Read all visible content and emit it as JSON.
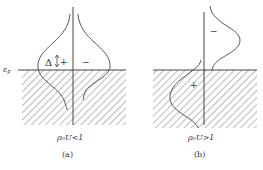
{
  "panels": [
    {
      "id": "a",
      "fermi_label": "ε",
      "fermi_sub": "F",
      "gap_label": "Δ",
      "plus": "+",
      "minus": "−",
      "condition": "ρ₀U<1",
      "caption": "(a)"
    },
    {
      "id": "b",
      "plus": "+",
      "minus": "−",
      "condition": "ρ₀U>1",
      "caption": "(b)"
    }
  ],
  "colors": {
    "line": "#444444",
    "hatch": "#7a7a7a"
  }
}
